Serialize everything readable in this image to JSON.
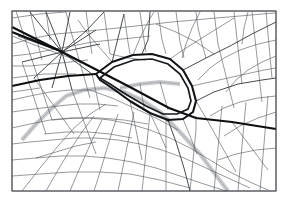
{
  "document": {
    "type": "street-map",
    "title": "City Street Map",
    "style": "monochrome line map",
    "width": 288,
    "height": 204
  },
  "colors": {
    "background": "#ffffff",
    "frame": "#4a4e52",
    "street_thin": "#555a5e",
    "street_medium": "#3c4145",
    "street_major": "#16191c",
    "boulevard": "#0c0e10",
    "ring_road": "#111316",
    "rail_band": "#c8cace",
    "rail_tick": "#9a9da1"
  },
  "frame": {
    "x": 12,
    "y": 11,
    "width": 264,
    "height": 180
  },
  "features": {
    "ring_road_label": "central ring boundary",
    "boulevard_label": "main diagonal boulevard",
    "star_junction_label": "radial star junction",
    "rail_label": "hatched rail corridor"
  },
  "map_geometry": {
    "ring_road": [
      "M 96 74 L 112 62 L 133 55 L 152 54 L 170 59 L 183 70 L 192 86 L 196 101 L 193 112 L 183 119 L 168 120 L 150 113 L 130 101 L 112 88 L 100 80 Z"
    ],
    "ring_road_inner": [
      "M 100 78 L 114 67 L 134 60 L 152 59 L 168 64 L 180 74 L 188 88 L 191 101 L 188 109 L 177 114 L 163 114 L 146 106 L 127 95 L 110 84 Z"
    ],
    "boulevards": [
      "M 12 27 L 62 52 L 128 86 L 169 108 L 196 118 L 232 122 L 276 129",
      "M 96 74 L 68 76 L 40 80 L 12 86",
      "M 12 32 L 58 50"
    ],
    "major_streets": [
      "M 62 52 L 86 31 L 104 12",
      "M 62 52 L 70 12",
      "M 62 52 L 46 12",
      "M 62 52 L 30 12",
      "M 62 52 L 18 36",
      "M 62 52 L 22 62",
      "M 62 52 L 34 78",
      "M 62 52 L 52 88",
      "M 62 52 L 72 90",
      "M 62 52 L 92 74",
      "M 62 52 L 100 44",
      "M 62 52 L 96 30",
      "M 150 12 L 148 40 L 142 54",
      "M 196 101 L 214 92 L 238 84 L 262 80 L 276 78",
      "M 168 120 L 176 142 L 184 168 L 190 191",
      "M 112 62 L 118 38 L 124 14",
      "M 183 70 L 206 58 L 230 46 L 252 34 L 276 22"
    ],
    "rail_corridors": [
      "M 22 140 L 36 124 L 52 108 L 66 96 L 84 90 L 104 88 L 124 92 L 142 100 L 160 112 L 180 132 L 200 154 L 218 178 L 228 191",
      "M 120 88 L 140 84 L 160 82 L 180 84"
    ],
    "street_network": [
      "M 12 11 L 276 11",
      "M 12 191 L 276 191",
      "M 12 11 L 12 191",
      "M 276 11 L 276 191",
      "M 12 18 L 40 14 L 66 12",
      "M 12 44 L 34 38 L 56 34 L 78 32 L 98 30 L 118 28 L 136 26 L 154 24 L 172 22 L 194 20 L 216 18 L 240 16 L 262 14 L 276 13",
      "M 12 56 L 30 54 L 50 50 L 72 46 L 92 42 L 112 40 L 132 38 L 150 36",
      "M 12 66 L 30 66 L 50 64 L 70 62 L 88 60",
      "M 16 11 L 22 30 L 28 48 L 34 66 L 40 84 L 46 102 L 52 120",
      "M 30 11 L 34 28 L 38 44 L 42 60",
      "M 46 11 L 48 26 L 50 40",
      "M 66 12 L 70 28 L 74 42 L 78 56 L 82 70 L 86 84 L 90 98",
      "M 86 11 L 88 26 L 90 40 L 92 54",
      "M 104 12 L 106 26 L 108 40 L 110 54",
      "M 124 14 L 126 28 L 128 42 L 130 54",
      "M 140 12 L 142 26 L 144 40 L 146 52",
      "M 158 12 L 160 26 L 162 40 L 166 54",
      "M 176 12 L 178 26 L 180 42 L 184 58",
      "M 196 12 L 198 28 L 202 44 L 206 58",
      "M 214 12 L 216 28 L 218 44 L 222 60 L 226 76 L 230 92 L 234 108",
      "M 234 12 L 236 30 L 238 48 L 240 66 L 242 84",
      "M 252 12 L 254 30 L 256 48 L 258 66 L 260 84 L 262 102",
      "M 266 12 L 268 34 L 270 56 L 272 78",
      "M 12 100 L 30 96 L 50 92 L 70 90 L 90 90",
      "M 12 112 L 26 110 L 42 108 L 58 106",
      "M 12 128 L 30 124 L 50 120 L 70 118 L 90 118 L 110 120 L 130 124 L 150 130 L 170 138 L 190 148 L 210 160 L 230 172 L 250 182 L 268 190",
      "M 12 144 L 30 142 L 52 140 L 74 138 L 96 138 L 118 140 L 140 144 L 162 150 L 184 158 L 206 168 L 228 178 L 250 188",
      "M 12 160 L 36 158 L 60 156 L 84 156 L 108 158 L 132 162 L 156 168 L 180 176 L 204 184 L 226 191",
      "M 12 176 L 40 174 L 70 172 L 100 172 L 130 174 L 160 180 L 190 188",
      "M 22 191 L 40 168 L 58 146 L 74 128 L 90 114 L 106 104",
      "M 46 191 L 58 170 L 70 150 L 82 132 L 94 116",
      "M 70 191 L 78 172 L 86 154 L 94 136 L 102 120",
      "M 94 191 L 100 172 L 106 152 L 112 132 L 118 114",
      "M 118 191 L 122 172 L 126 152 L 130 132 L 134 112",
      "M 142 191 L 144 172 L 146 152 L 148 132 L 150 114",
      "M 166 191 L 166 172 L 166 152 L 166 134 L 166 120",
      "M 190 191 L 192 170 L 194 150 L 196 130 L 196 116",
      "M 214 191 L 216 170 L 218 148 L 220 126 L 222 106",
      "M 238 191 L 240 168 L 242 146 L 244 124 L 246 102",
      "M 260 191 L 262 168 L 264 144 L 266 120 L 268 96",
      "M 90 90 L 112 98 L 134 108 L 156 118 L 178 130",
      "M 52 120 L 76 118 L 100 118 L 124 120 L 148 124",
      "M 196 101 L 206 118 L 216 136 L 226 154 L 236 172",
      "M 232 122 L 244 138 L 256 154 L 268 170",
      "M 192 86 L 210 82 L 228 78 L 246 74 L 264 70 L 276 68",
      "M 170 59 L 186 48 L 202 38 L 218 28 L 234 18",
      "M 133 55 L 140 38 L 148 22 L 154 12",
      "M 112 62 L 100 48 L 88 34 L 78 20",
      "M 276 40 L 258 44 L 240 50 L 224 58 L 210 68 L 198 80",
      "M 276 56 L 262 62 L 248 70 L 236 80 L 226 92",
      "M 276 96 L 258 98 L 240 102 L 224 108 L 210 116",
      "M 276 112 L 258 118 L 240 126 L 224 136",
      "M 276 148 L 256 150 L 236 154 L 218 160",
      "M 12 78 L 28 76 L 44 74 L 60 74 L 76 74",
      "M 12 92 L 26 90 L 40 88",
      "M 34 78 L 44 92 L 54 106 L 64 120 L 74 134",
      "M 22 62 L 28 80 L 34 98 L 40 116 L 46 134",
      "M 72 90 L 78 106 L 84 122 L 90 138 L 96 154",
      "M 92 74 L 96 92 L 100 110",
      "M 150 113 L 158 130 L 166 148",
      "M 130 101 L 134 120 L 138 140 L 142 160",
      "M 183 119 L 190 136 L 197 154",
      "M 12 36 L 32 44 L 54 52 L 76 60",
      "M 200 12 L 192 28 L 186 44 L 182 58",
      "M 248 12 L 244 28 L 242 44",
      "M 156 24 L 176 32 L 196 42 L 214 54",
      "M 110 54 L 128 58 L 146 60",
      "M 58 106 L 78 104 L 98 104 L 118 106",
      "M 44 134 L 66 132 L 88 132 L 110 134 L 132 138",
      "M 36 158 L 56 152 L 76 146 L 96 142",
      "M 160 82 L 164 96 L 168 110",
      "M 140 84 L 142 96 L 144 108"
    ]
  }
}
